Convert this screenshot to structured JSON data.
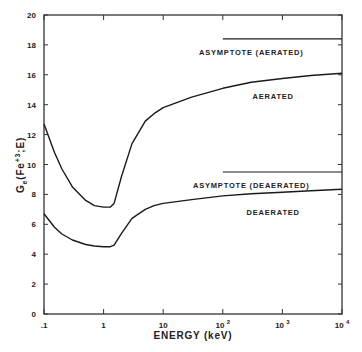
{
  "chart_data": {
    "type": "line",
    "title": "",
    "xlabel": "ENERGY (keV)",
    "ylabel": "G_e(Fe+3;E)",
    "xscale": "log",
    "xlim": [
      0.1,
      10000
    ],
    "ylim": [
      0,
      20
    ],
    "x_ticks": [
      ".1",
      "1",
      "10",
      "10 2",
      "10 3",
      "10 4"
    ],
    "y_ticks": [
      "0",
      "2",
      "4",
      "6",
      "8",
      "10",
      "12",
      "14",
      "16",
      "18",
      "20"
    ],
    "grid": false,
    "legend": "none (inline annotations)",
    "series": [
      {
        "name": "AERATED",
        "x": [
          0.1,
          0.15,
          0.2,
          0.3,
          0.5,
          0.7,
          1.0,
          1.3,
          1.5,
          2.0,
          3.0,
          5.0,
          7.0,
          10,
          30,
          100,
          300,
          1000,
          3000,
          10000
        ],
        "y": [
          12.7,
          10.8,
          9.7,
          8.5,
          7.6,
          7.25,
          7.15,
          7.15,
          7.4,
          9.2,
          11.4,
          12.9,
          13.4,
          13.8,
          14.5,
          15.1,
          15.5,
          15.75,
          15.95,
          16.1
        ]
      },
      {
        "name": "DEAERATED",
        "x": [
          0.1,
          0.15,
          0.2,
          0.3,
          0.5,
          0.7,
          1.0,
          1.3,
          1.5,
          2.0,
          3.0,
          5.0,
          7.0,
          10,
          30,
          100,
          300,
          1000,
          3000,
          10000
        ],
        "y": [
          6.7,
          5.8,
          5.35,
          4.95,
          4.65,
          4.55,
          4.5,
          4.5,
          4.6,
          5.4,
          6.4,
          7.0,
          7.25,
          7.4,
          7.65,
          7.9,
          8.05,
          8.15,
          8.25,
          8.35
        ]
      },
      {
        "name": "ASYMPTOTE (AERATED)",
        "x": [
          100,
          10000
        ],
        "y": [
          18.4,
          18.4
        ]
      },
      {
        "name": "ASYMPTOTE (DEAERATED)",
        "x": [
          100,
          10000
        ],
        "y": [
          9.5,
          9.5
        ]
      }
    ],
    "annotations": [
      {
        "text": "ASYMPTOTE (AERATED)",
        "x": 300,
        "y": 17.5
      },
      {
        "text": "AERATED",
        "x": 700,
        "y": 14.6
      },
      {
        "text": "ASYMPTOTE (DEAERATED)",
        "x": 300,
        "y": 8.6
      },
      {
        "text": "DEAERATED",
        "x": 700,
        "y": 6.8
      }
    ]
  }
}
